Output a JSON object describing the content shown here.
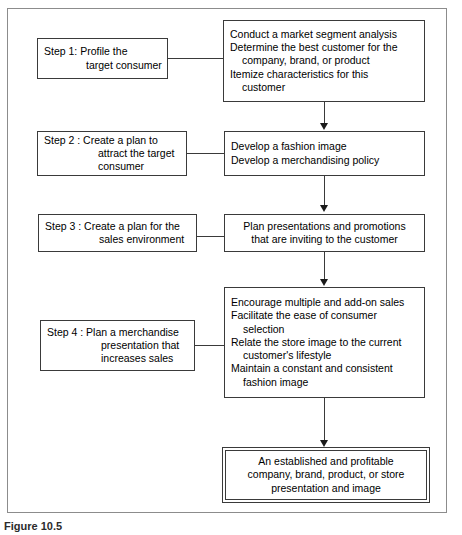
{
  "figure": {
    "caption": "Figure 10.5"
  },
  "steps": [
    {
      "id": "step-1",
      "lines": [
        "Step 1: Profile the",
        "target consumer"
      ]
    },
    {
      "id": "step-2",
      "lines": [
        "Step 2 : Create a plan to",
        "attract the target",
        "consumer"
      ]
    },
    {
      "id": "step-3",
      "lines": [
        "Step 3 : Create a plan for the",
        "sales environment"
      ]
    },
    {
      "id": "step-4",
      "lines": [
        "Step 4 : Plan a merchandise",
        "presentation that",
        "increases sales"
      ]
    }
  ],
  "details": [
    {
      "id": "detail-1",
      "lines": [
        {
          "text": "Conduct a market segment analysis",
          "continuation": false
        },
        {
          "text": "Determine the best customer for the",
          "continuation": false
        },
        {
          "text": "company, brand, or product",
          "continuation": true
        },
        {
          "text": "Itemize characteristics for this",
          "continuation": false
        },
        {
          "text": "customer",
          "continuation": true
        }
      ]
    },
    {
      "id": "detail-2",
      "lines": [
        {
          "text": "Develop a fashion image",
          "continuation": false
        },
        {
          "text": "Develop a merchandising policy",
          "continuation": false
        }
      ]
    },
    {
      "id": "detail-3",
      "lines": [
        {
          "text": "Plan presentations and promotions",
          "continuation": false
        },
        {
          "text": "that are inviting to the customer",
          "continuation": false
        }
      ]
    },
    {
      "id": "detail-4",
      "lines": [
        {
          "text": "Encourage multiple and add-on sales",
          "continuation": false
        },
        {
          "text": "Facilitate the ease of consumer",
          "continuation": false
        },
        {
          "text": "selection",
          "continuation": true
        },
        {
          "text": "Relate the store image to the current",
          "continuation": false
        },
        {
          "text": "customer's lifestyle",
          "continuation": true
        },
        {
          "text": "Maintain a constant and consistent",
          "continuation": false
        },
        {
          "text": "fashion image",
          "continuation": true
        }
      ]
    }
  ],
  "outcome": {
    "lines": [
      "An established and profitable",
      "company, brand, product, or store",
      "presentation and image"
    ]
  },
  "colors": {
    "box_border": "#3a3a3a",
    "frame_border": "#8c8c8c",
    "text": "#000000",
    "background": "#ffffff"
  }
}
